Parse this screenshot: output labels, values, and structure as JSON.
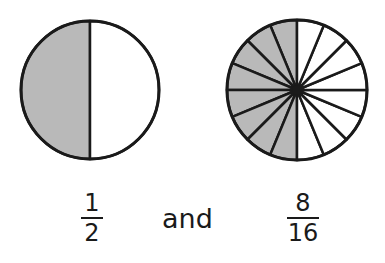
{
  "figures": [
    {
      "name": "circle-halves",
      "center": [
        90,
        90
      ],
      "radius": 69,
      "parts": 2,
      "shaded": 1,
      "shaded_side": "left"
    },
    {
      "name": "circle-sixteenths",
      "center": [
        297,
        90
      ],
      "radius": 70,
      "parts": 16,
      "shaded": 8,
      "shaded_side": "left"
    }
  ],
  "colors": {
    "shade": "#b9b9b9",
    "stroke": "#1a1a1a",
    "background": "#ffffff"
  },
  "labels": {
    "fraction_left": {
      "numerator": "1",
      "denominator": "2"
    },
    "connector": "and",
    "fraction_right": {
      "numerator": "8",
      "denominator": "16"
    }
  }
}
